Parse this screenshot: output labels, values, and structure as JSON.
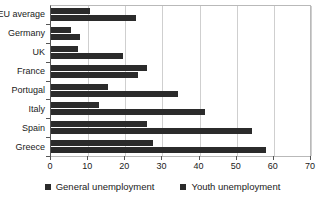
{
  "chart_data": {
    "type": "bar",
    "orientation": "horizontal",
    "title": "",
    "subtitle": "",
    "xlabel": "",
    "ylabel": "",
    "xlim": [
      0,
      70
    ],
    "xticks": [
      0,
      10,
      20,
      30,
      40,
      50,
      60,
      70
    ],
    "xtick_labels": [
      "0",
      "10",
      "20",
      "30",
      "40",
      "50",
      "60",
      "70"
    ],
    "grid": "vertical",
    "legend_position": "bottom-center",
    "categories": [
      "EU average",
      "Germany",
      "UK",
      "France",
      "Portugal",
      "Italy",
      "Spain",
      "Greece"
    ],
    "series": [
      {
        "name": "General unemployment",
        "color": "#2b2b2b",
        "values": [
          10.5,
          5.3,
          7.3,
          25.8,
          15.3,
          12.8,
          25.8,
          27.5
        ]
      },
      {
        "name": "Youth unemployment",
        "color": "#2b2b2b",
        "values": [
          23.0,
          7.7,
          19.5,
          23.5,
          34.3,
          41.5,
          54.0,
          58.0
        ]
      }
    ]
  },
  "legend": {
    "items": [
      {
        "label": "General unemployment",
        "marker": "square-marker-icon"
      },
      {
        "label": "Youth unemployment",
        "marker": "square-marker-icon"
      }
    ]
  },
  "colors": {
    "bar": "#2b2b2b",
    "gridline": "#cfcfcf",
    "axis": "#555555",
    "plot_border": "#b9b9b9",
    "background": "#ffffff",
    "text": "#1a1a1a"
  }
}
